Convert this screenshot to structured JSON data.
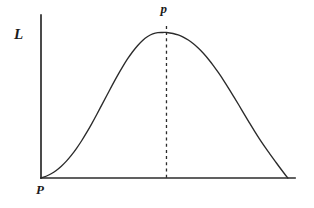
{
  "figure": {
    "background_color": "#ffffff",
    "ink_color": "#2b2b2b",
    "y_axis_label": "L",
    "x_axis_origin_label": "P",
    "peak_label_base": "p",
    "peak_label_accent": "ˆ",
    "peak_label_full": "p̂"
  },
  "chart_data": {
    "type": "line",
    "title": "",
    "xlabel": "P",
    "ylabel": "L",
    "grid": false,
    "legend": null,
    "xlim": [
      0,
      1
    ],
    "ylim": [
      0,
      1.12
    ],
    "axis_pixels": {
      "origin_x": 41,
      "origin_y": 178,
      "y_axis_top_y": 15,
      "x_axis_right_x": 295
    },
    "annotations": [
      {
        "name": "mle-dashed-line",
        "type": "vline",
        "label": "p̂",
        "x": 0.494,
        "y_top": 1.045,
        "style": "dashed"
      },
      {
        "name": "origin-label",
        "type": "text",
        "label": "P",
        "x": 0.0,
        "y": -0.08
      },
      {
        "name": "y-axis-label",
        "type": "text",
        "label": "L",
        "x": -0.1,
        "y": 0.92
      }
    ],
    "series": [
      {
        "name": "likelihood",
        "style": "solid",
        "color": "#2b2b2b",
        "x": [
          0.0,
          0.02,
          0.04,
          0.06,
          0.08,
          0.1,
          0.12,
          0.14,
          0.16,
          0.18,
          0.2,
          0.22,
          0.24,
          0.26,
          0.28,
          0.3,
          0.32,
          0.34,
          0.36,
          0.38,
          0.4,
          0.42,
          0.44,
          0.46,
          0.48,
          0.494,
          0.52,
          0.54,
          0.56,
          0.58,
          0.6,
          0.62,
          0.64,
          0.66,
          0.68,
          0.7,
          0.72,
          0.74,
          0.76,
          0.78,
          0.8,
          0.82,
          0.84,
          0.86,
          0.88,
          0.9,
          0.92,
          0.94,
          0.96,
          0.972
        ],
        "y": [
          0.0,
          0.012,
          0.029,
          0.052,
          0.081,
          0.116,
          0.157,
          0.204,
          0.256,
          0.313,
          0.374,
          0.438,
          0.504,
          0.57,
          0.636,
          0.7,
          0.76,
          0.816,
          0.866,
          0.909,
          0.945,
          0.972,
          0.99,
          0.999,
          1.0,
          1.0,
          0.993,
          0.983,
          0.968,
          0.948,
          0.922,
          0.891,
          0.855,
          0.814,
          0.769,
          0.72,
          0.668,
          0.613,
          0.556,
          0.498,
          0.439,
          0.381,
          0.324,
          0.269,
          0.217,
          0.168,
          0.12,
          0.072,
          0.026,
          0.0
        ]
      }
    ]
  }
}
